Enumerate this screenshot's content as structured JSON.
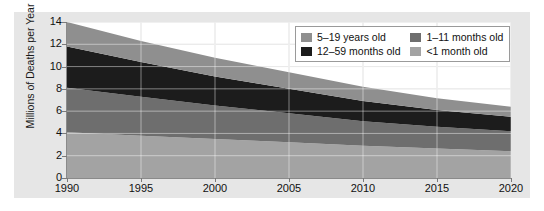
{
  "chart_data": {
    "type": "area",
    "title": "",
    "xlabel": "",
    "ylabel": "Millions of Deaths per Year",
    "xlim": [
      1990,
      2020
    ],
    "ylim": [
      0,
      14
    ],
    "ytick_labels": [
      "0",
      "2",
      "4",
      "6",
      "8",
      "10",
      "12",
      "14"
    ],
    "ytick_values": [
      0,
      2,
      4,
      6,
      8,
      10,
      12,
      14
    ],
    "xtick_labels": [
      "1990",
      "1995",
      "2000",
      "2005",
      "2010",
      "2015",
      "2020"
    ],
    "xtick_values": [
      1990,
      1995,
      2000,
      2005,
      2010,
      2015,
      2020
    ],
    "grid": true,
    "stacked": true,
    "legend_position": "upper right",
    "x": [
      1990,
      1995,
      2000,
      2005,
      2010,
      2015,
      2020
    ],
    "series": [
      {
        "name": "<1 month old",
        "color": "#a3a3a3",
        "values": [
          4.1,
          3.8,
          3.5,
          3.2,
          2.9,
          2.65,
          2.4
        ]
      },
      {
        "name": "1-11 months old",
        "color": "#6e6e6e",
        "values": [
          4.0,
          3.5,
          3.0,
          2.6,
          2.2,
          1.95,
          1.8
        ]
      },
      {
        "name": "12-59 months old",
        "color": "#1c1c1c",
        "values": [
          3.7,
          3.1,
          2.6,
          2.2,
          1.8,
          1.5,
          1.3
        ]
      },
      {
        "name": "5-19 years old",
        "color": "#8f8f8f",
        "values": [
          2.2,
          1.9,
          1.7,
          1.5,
          1.3,
          1.05,
          0.9
        ]
      }
    ],
    "cumulative_tops": {
      "<1 month old": [
        4.1,
        3.8,
        3.5,
        3.2,
        2.9,
        2.65,
        2.4
      ],
      "1-11 months old": [
        8.1,
        7.3,
        6.5,
        5.8,
        5.1,
        4.6,
        4.2
      ],
      "12-59 months old": [
        11.8,
        10.4,
        9.1,
        8.0,
        6.9,
        6.1,
        5.5
      ],
      "5-19 years old": [
        14.0,
        12.3,
        10.8,
        9.5,
        8.2,
        7.15,
        6.4
      ]
    }
  },
  "legend": {
    "entries": [
      {
        "label": "5-19 years old",
        "color": "#8f8f8f"
      },
      {
        "label": "1-11 months old",
        "color": "#6e6e6e"
      },
      {
        "label": "12-59 months old",
        "color": "#1c1c1c"
      },
      {
        "label": "<1 month old",
        "color": "#a3a3a3"
      }
    ]
  },
  "axes": {
    "y_title": "Millions of Deaths per Year"
  },
  "colors": {
    "panel_background": "#e6e6e6",
    "plot_background": "#ffffff",
    "gridline": "#d9d9d9",
    "axis_line": "#8a8a8a",
    "text": "#111111"
  }
}
